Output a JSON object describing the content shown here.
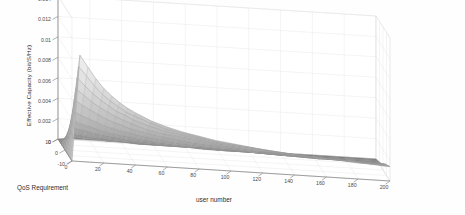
{
  "figure": {
    "background": "#fefefe",
    "type": "matlab-3d-surface"
  },
  "axes": {
    "x": {
      "label": "user number",
      "ticks": [
        "0",
        "20",
        "40",
        "60",
        "80",
        "100",
        "120",
        "140",
        "160",
        "180",
        "200"
      ],
      "range": [
        0,
        200
      ]
    },
    "y": {
      "label": "QoS Requirement",
      "ticks": [
        "10",
        "0",
        "-10"
      ],
      "range": [
        -10,
        10
      ]
    },
    "z": {
      "label": "Effective Capacity  (bit/S/Hz)",
      "ticks": [
        "0.014",
        "0.012",
        "0.01",
        "0.008",
        "0.006",
        "0.004",
        "0.002",
        "0"
      ],
      "range": [
        0,
        0.014
      ]
    }
  },
  "colors": {
    "grid": "#e3e3e3",
    "axis": "#7d7d7d",
    "mesh_light": "#e8e8e8",
    "mesh_mid": "#bdbdbd",
    "mesh_dark": "#8a8a8a",
    "tick_text": "#4a4a4a",
    "label_text": "#2e2e2e"
  },
  "chart_data": {
    "type": "surface",
    "title": "",
    "xlabel": "user number",
    "ylabel": "QoS Requirement",
    "zlabel": "Effective Capacity  (bit/S/Hz)",
    "xlim": [
      0,
      200
    ],
    "ylim": [
      -10,
      10
    ],
    "zlim": [
      0,
      0.014
    ],
    "grid": true,
    "legend": null,
    "colormap": "gray",
    "x": [
      0,
      5,
      10,
      15,
      20,
      25,
      30,
      35,
      40,
      50,
      60,
      70,
      80,
      90,
      100,
      120,
      140,
      160,
      180,
      200
    ],
    "y": [
      -10,
      -8,
      -6,
      -4,
      -2,
      0,
      2,
      4,
      6,
      8,
      10
    ],
    "series": [
      {
        "name": "QoS = 10",
        "values": [
          0.0,
          0.0104,
          0.0093,
          0.0082,
          0.0073,
          0.0066,
          0.006,
          0.0055,
          0.0051,
          0.0044,
          0.0039,
          0.0035,
          0.0032,
          0.0029,
          0.0027,
          0.0023,
          0.002,
          0.0018,
          0.0016,
          0.0014
        ]
      },
      {
        "name": "QoS = 8",
        "values": [
          0.0,
          0.0091,
          0.0082,
          0.0073,
          0.0065,
          0.0059,
          0.0054,
          0.0049,
          0.0046,
          0.004,
          0.0035,
          0.0032,
          0.0029,
          0.0026,
          0.0024,
          0.0021,
          0.0018,
          0.0016,
          0.0014,
          0.0013
        ]
      },
      {
        "name": "QoS = 6",
        "values": [
          0.0,
          0.0078,
          0.007,
          0.0063,
          0.0057,
          0.0052,
          0.0047,
          0.0044,
          0.004,
          0.0035,
          0.0031,
          0.0028,
          0.0026,
          0.0023,
          0.0021,
          0.0018,
          0.0016,
          0.0014,
          0.0013,
          0.0011
        ]
      },
      {
        "name": "QoS = 4",
        "values": [
          0.0,
          0.0065,
          0.0059,
          0.0053,
          0.0048,
          0.0044,
          0.004,
          0.0037,
          0.0034,
          0.0029,
          0.0026,
          0.0024,
          0.0022,
          0.002,
          0.0018,
          0.0015,
          0.0013,
          0.0012,
          0.0011,
          0.001
        ]
      },
      {
        "name": "QoS = 2",
        "values": [
          0.0,
          0.0052,
          0.0047,
          0.0043,
          0.0039,
          0.0035,
          0.0032,
          0.003,
          0.0027,
          0.0024,
          0.0021,
          0.0019,
          0.0017,
          0.0016,
          0.0015,
          0.0012,
          0.0011,
          0.001,
          0.0009,
          0.0008
        ]
      },
      {
        "name": "QoS = 0",
        "values": [
          0.0,
          0.0039,
          0.0035,
          0.0032,
          0.0029,
          0.0026,
          0.0024,
          0.0022,
          0.0021,
          0.0018,
          0.0016,
          0.0014,
          0.0013,
          0.0012,
          0.0011,
          0.0009,
          0.0008,
          0.0007,
          0.0007,
          0.0006
        ]
      },
      {
        "name": "QoS = -2",
        "values": [
          0.0,
          0.0028,
          0.0025,
          0.0023,
          0.0021,
          0.0019,
          0.0017,
          0.0016,
          0.0015,
          0.0013,
          0.0011,
          0.001,
          0.0009,
          0.0009,
          0.0008,
          0.0007,
          0.0006,
          0.0005,
          0.0005,
          0.0004
        ]
      },
      {
        "name": "QoS = -4",
        "values": [
          0.0,
          0.0019,
          0.0017,
          0.0016,
          0.0014,
          0.0013,
          0.0012,
          0.0011,
          0.001,
          0.0009,
          0.0008,
          0.0007,
          0.0006,
          0.0006,
          0.0005,
          0.0005,
          0.0004,
          0.0004,
          0.0003,
          0.0003
        ]
      },
      {
        "name": "QoS = -6",
        "values": [
          0.0,
          0.0011,
          0.001,
          0.0009,
          0.0008,
          0.0008,
          0.0007,
          0.0006,
          0.0006,
          0.0005,
          0.0005,
          0.0004,
          0.0004,
          0.0003,
          0.0003,
          0.0003,
          0.0002,
          0.0002,
          0.0002,
          0.0002
        ]
      },
      {
        "name": "QoS = -8",
        "values": [
          0.0,
          0.0005,
          0.0005,
          0.0004,
          0.0004,
          0.0004,
          0.0003,
          0.0003,
          0.0003,
          0.0002,
          0.0002,
          0.0002,
          0.0002,
          0.0002,
          0.0001,
          0.0001,
          0.0001,
          0.0001,
          0.0001,
          0.0001
        ]
      },
      {
        "name": "QoS = -10",
        "values": [
          0.0,
          0.0001,
          0.0001,
          0.0001,
          0.0001,
          0.0001,
          0.0001,
          0.0001,
          0.0001,
          0.0001,
          0.0,
          0.0,
          0.0,
          0.0,
          0.0,
          0.0,
          0.0,
          0.0,
          0.0,
          0.0
        ]
      }
    ]
  }
}
